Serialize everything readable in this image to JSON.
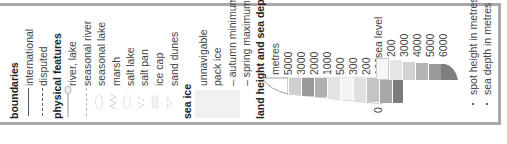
{
  "legend": {
    "boundaries": {
      "heading": "boundaries",
      "items": [
        {
          "label": "international",
          "symbol": "solid-line"
        },
        {
          "label": "disputed",
          "symbol": "dashed-line"
        }
      ]
    },
    "physical_features": {
      "heading": "physical features",
      "items": [
        {
          "label": "river, lake",
          "symbol": "river-lake"
        },
        {
          "label": "seasonal river",
          "symbol": "seasonal-river"
        },
        {
          "label": "seasonal lake",
          "symbol": "seasonal-lake"
        },
        {
          "label": "marsh",
          "symbol": "marsh"
        },
        {
          "label": "salt lake",
          "symbol": "salt-lake"
        },
        {
          "label": "salt pan",
          "symbol": "salt-pan"
        },
        {
          "label": "ice cap",
          "symbol": "ice-cap"
        },
        {
          "label": "sand dunes",
          "symbol": "sand-dunes"
        }
      ]
    },
    "sea_ice": {
      "heading": "sea ice",
      "items": [
        {
          "label": "unnavigable"
        },
        {
          "label": "pack ice"
        },
        {
          "label": "– autumn minimum"
        },
        {
          "label": "– spring maximum"
        }
      ]
    },
    "land_height_sea_depth": {
      "heading": "land height and sea depth",
      "unit": "metres",
      "land_levels": [
        "5000",
        "3000",
        "2000",
        "1000",
        "500",
        "300",
        "200",
        "100"
      ],
      "zero_label": "0",
      "sea_level_label": "sea level",
      "sea_levels": [
        "200",
        "3000",
        "4000",
        "5000",
        "6000"
      ],
      "land_colors": [
        "#cfcfcf",
        "#9a9a9a",
        "#b0b0b0",
        "#e4e4e4",
        "#f4f4f4",
        "#e0e0e0",
        "#c4c4c4",
        "#a8a8a8",
        "#7c7c7c"
      ],
      "sea_colors": [
        "#f6f6f6",
        "#e6e6e6",
        "#d2d2d2",
        "#b4b4b4",
        "#9a9a9a",
        "#7e7e7e"
      ]
    },
    "spot_symbols": [
      {
        "label": "spot height in metres",
        "symbol": "dot"
      },
      {
        "label": "sea depth in metres",
        "symbol": "dot"
      }
    ]
  }
}
